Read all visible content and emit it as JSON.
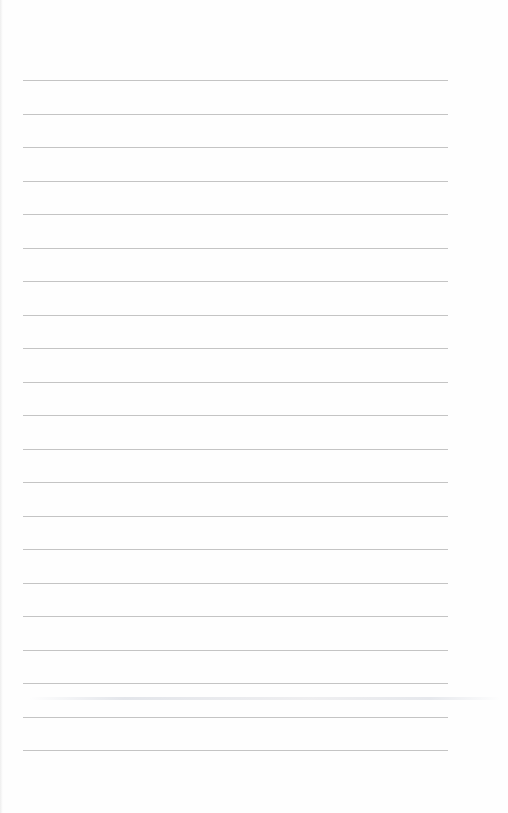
{
  "page": {
    "type": "blank lined paper",
    "background_color": "#fefefe",
    "rule_color": "#c4c4c4",
    "rule_count": 21,
    "rule_left_px": 23,
    "rule_right_px": 448,
    "first_rule_y_px": 80,
    "rule_spacing_px": 33.5,
    "text": ""
  }
}
